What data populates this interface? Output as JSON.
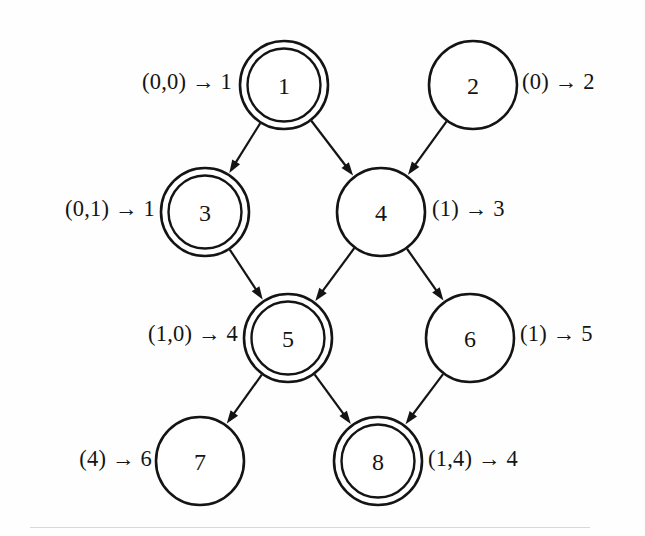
{
  "diagram": {
    "kind": "state-transition-graph",
    "title": "",
    "stroke_color": "#141414",
    "background_color": "#ffffff",
    "nodes": [
      {
        "id": "n1",
        "label": "1",
        "cx": 284,
        "cy": 85,
        "r": 44,
        "double": true,
        "name": "node-1"
      },
      {
        "id": "n2",
        "label": "2",
        "cx": 473,
        "cy": 85,
        "r": 44,
        "double": false,
        "name": "node-2"
      },
      {
        "id": "n3",
        "label": "3",
        "cx": 205,
        "cy": 212,
        "r": 44,
        "double": true,
        "name": "node-3"
      },
      {
        "id": "n4",
        "label": "4",
        "cx": 381,
        "cy": 212,
        "r": 44,
        "double": false,
        "name": "node-4"
      },
      {
        "id": "n5",
        "label": "5",
        "cx": 288,
        "cy": 338,
        "r": 44,
        "double": true,
        "name": "node-5"
      },
      {
        "id": "n6",
        "label": "6",
        "cx": 470,
        "cy": 338,
        "r": 44,
        "double": false,
        "name": "node-6"
      },
      {
        "id": "n7",
        "label": "7",
        "cx": 200,
        "cy": 461,
        "r": 44,
        "double": false,
        "name": "node-7"
      },
      {
        "id": "n8",
        "label": "8",
        "cx": 378,
        "cy": 461,
        "r": 44,
        "double": true,
        "name": "node-8"
      }
    ],
    "edges": [
      {
        "from": "n1",
        "to": "n3",
        "name": "edge-1-to-3"
      },
      {
        "from": "n1",
        "to": "n4",
        "name": "edge-1-to-4"
      },
      {
        "from": "n2",
        "to": "n4",
        "name": "edge-2-to-4"
      },
      {
        "from": "n3",
        "to": "n5",
        "name": "edge-3-to-5"
      },
      {
        "from": "n4",
        "to": "n5",
        "name": "edge-4-to-5"
      },
      {
        "from": "n4",
        "to": "n6",
        "name": "edge-4-to-6"
      },
      {
        "from": "n5",
        "to": "n7",
        "name": "edge-5-to-7"
      },
      {
        "from": "n5",
        "to": "n8",
        "name": "edge-5-to-8"
      },
      {
        "from": "n6",
        "to": "n8",
        "name": "edge-6-to-8"
      }
    ],
    "annotations": [
      {
        "id": "a1",
        "text": "(0,0) → 1",
        "node": "n1",
        "side": "left",
        "x": 232,
        "y": 82,
        "name": "annotation-node-1"
      },
      {
        "id": "a2",
        "text": "(0) → 2",
        "node": "n2",
        "side": "right",
        "x": 522,
        "y": 82,
        "name": "annotation-node-2"
      },
      {
        "id": "a3",
        "text": "(0,1) → 1",
        "node": "n3",
        "side": "left",
        "x": 155,
        "y": 209,
        "name": "annotation-node-3"
      },
      {
        "id": "a4",
        "text": "(1) → 3",
        "node": "n4",
        "side": "right",
        "x": 432,
        "y": 209,
        "name": "annotation-node-4"
      },
      {
        "id": "a5",
        "text": "(1,0) → 4",
        "node": "n5",
        "side": "left",
        "x": 238,
        "y": 334,
        "name": "annotation-node-5"
      },
      {
        "id": "a6",
        "text": "(1) → 5",
        "node": "n6",
        "side": "right",
        "x": 520,
        "y": 334,
        "name": "annotation-node-6"
      },
      {
        "id": "a7",
        "text": "(4) → 6",
        "node": "n7",
        "side": "left",
        "x": 152,
        "y": 459,
        "name": "annotation-node-7"
      },
      {
        "id": "a8",
        "text": "(1,4) → 4",
        "node": "n8",
        "side": "right",
        "x": 428,
        "y": 459,
        "name": "annotation-node-8"
      }
    ]
  }
}
